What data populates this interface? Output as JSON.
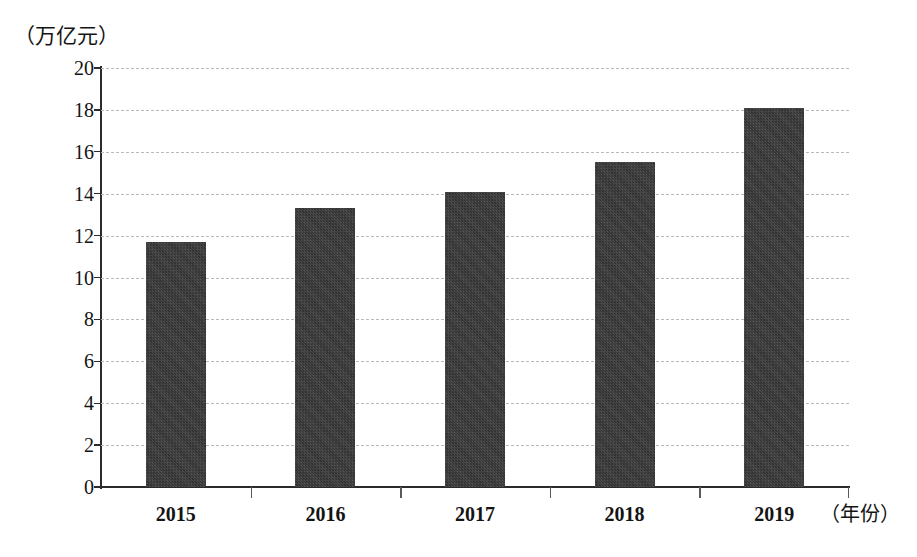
{
  "chart_data": {
    "type": "bar",
    "title": "",
    "subtitle": "",
    "xlabel": "（年份）",
    "ylabel": "（万亿元）",
    "categories": [
      "2015",
      "2016",
      "2017",
      "2018",
      "2019"
    ],
    "values": [
      11.7,
      13.3,
      14.1,
      15.5,
      18.1
    ],
    "series": [
      {
        "name": "",
        "values": [
          11.7,
          13.3,
          14.1,
          15.5,
          18.1
        ]
      }
    ],
    "ylim": [
      0,
      20
    ],
    "ytick_step": 2,
    "ytick_labels": [
      "20",
      "18",
      "16",
      "14",
      "12",
      "10",
      "8",
      "6",
      "4",
      "2",
      "0"
    ],
    "ytick_values": [
      20,
      18,
      16,
      14,
      12,
      10,
      8,
      6,
      4,
      2,
      0
    ],
    "grid": true,
    "grid_axis": "y",
    "grid_style": "dashed",
    "legend": false,
    "legend_position": "none",
    "bar_color": "#3b3b3b",
    "grid_color": "#b9b9b9",
    "axis_color": "#2b2b2b",
    "background_color": "#ffffff",
    "annotations": []
  },
  "axes": {
    "y_unit_caption": "（万亿元）",
    "x_unit_caption": "（年份）"
  }
}
